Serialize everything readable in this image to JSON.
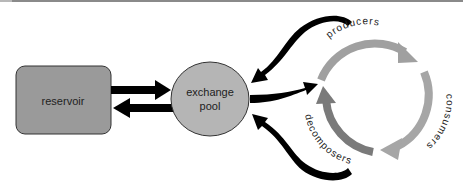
{
  "diagram": {
    "type": "biogeochemical-cycle",
    "nodes": {
      "reservoir": {
        "label": "reservoir",
        "fill": "#9a9a9a"
      },
      "exchange_pool": {
        "label_line1": "exchange",
        "label_line2": "pool",
        "fill": "#b5b5b5"
      }
    },
    "cycle": {
      "labels": {
        "producers": "producers",
        "consumers": "consumers",
        "decomposers": "decomposers"
      },
      "colors": {
        "producers_arc": "#a0a0a0",
        "consumers_arc": "#a6a6a6",
        "decomposers_arc": "#7a7a7a"
      }
    },
    "edges": [
      {
        "from": "reservoir",
        "to": "exchange_pool"
      },
      {
        "from": "exchange_pool",
        "to": "reservoir"
      },
      {
        "from": "exchange_pool",
        "to": "cycle"
      },
      {
        "from": "producers",
        "to": "exchange_pool"
      },
      {
        "from": "decomposers",
        "to": "exchange_pool"
      },
      {
        "from": "producers",
        "to": "consumers"
      },
      {
        "from": "consumers",
        "to": "decomposers"
      },
      {
        "from": "decomposers",
        "to": "producers"
      }
    ],
    "arrow_color": "#000000"
  }
}
